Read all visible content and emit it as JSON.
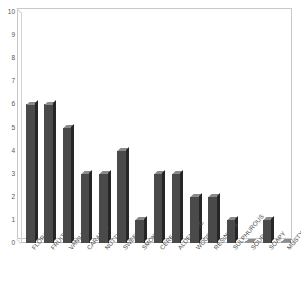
{
  "chart_data": {
    "type": "bar",
    "title": "",
    "xlabel": "",
    "ylabel": "",
    "ylim": [
      0,
      10
    ],
    "grid": false,
    "legend": null,
    "categories": [
      "FLORAL",
      "FRUITY",
      "VANILLA",
      "CARAMEL",
      "NUTTY",
      "SWEET",
      "SMOKY",
      "CEREAL",
      "ALDEHYDIC",
      "WOODY",
      "RESINOUS",
      "SULPHUROUS",
      "SOUR",
      "SOAPY",
      "MUSTY"
    ],
    "values": [
      6,
      6,
      5,
      3,
      3,
      4,
      1,
      3,
      3,
      2,
      2,
      1,
      0,
      1,
      0
    ],
    "yticks": [
      0,
      1,
      2,
      3,
      4,
      5,
      6,
      7,
      8,
      9,
      10
    ],
    "ytick_labels": [
      "0",
      "1",
      "2",
      "3",
      "4",
      "5",
      "6",
      "7",
      "8",
      "9",
      "10"
    ],
    "colors": {
      "bar_front": "#4a4a4a",
      "bar_side": "#262626",
      "bar_top": "#8a8a8a",
      "frame": "#c9c9c9",
      "text": "#4a4a4a",
      "background": "#ffffff"
    }
  }
}
